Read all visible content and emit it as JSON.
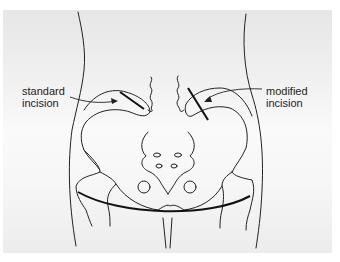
{
  "figure": {
    "title": "",
    "labels": {
      "standard": [
        "standard",
        "incision"
      ],
      "modified": [
        "modified",
        "incision"
      ]
    },
    "colors": {
      "line": "#222222",
      "background_top": "#e6e6e6",
      "background_mid": "#fafafa",
      "text": "#222222"
    }
  }
}
